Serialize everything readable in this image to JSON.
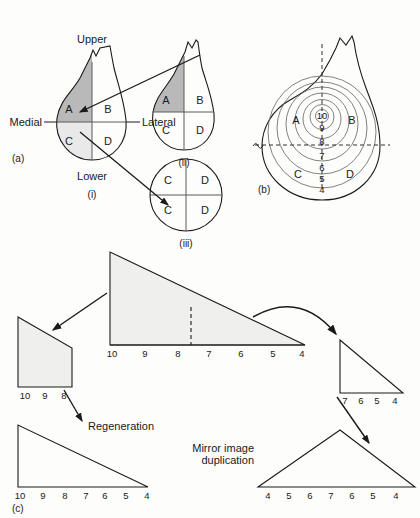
{
  "figure": {
    "background": "#fdfdfb",
    "ink": "#1a1a1a",
    "shade_dark": "#b9b9b9",
    "shade_light": "#e9e9e9",
    "shade_fill": "#efefed"
  },
  "panel_a": {
    "id": "(a)",
    "diagrams": [
      {
        "id": "(i)",
        "shape": "limb-bud-teardrop",
        "quadrants": [
          {
            "label": "A",
            "shade": "dark"
          },
          {
            "label": "B",
            "shade": "none"
          },
          {
            "label": "C",
            "shade": "light"
          },
          {
            "label": "D",
            "shade": "none"
          }
        ],
        "axis_labels": {
          "top": "Upper",
          "bottom": "Lower",
          "left": "Medial",
          "right": "Lateral"
        }
      },
      {
        "id": "(ii)",
        "shape": "limb-bud-teardrop",
        "quadrants": [
          {
            "label": "A",
            "shade": "dark"
          },
          {
            "label": "B",
            "shade": "none"
          },
          {
            "label": "C",
            "shade": "none"
          },
          {
            "label": "D",
            "shade": "none"
          }
        ]
      },
      {
        "id": "(iii)",
        "shape": "circle",
        "quadrants": [
          {
            "label": "C",
            "shade": "none"
          },
          {
            "label": "D",
            "shade": "none"
          },
          {
            "label": "C",
            "shade": "none"
          },
          {
            "label": "D",
            "shade": "none"
          }
        ]
      }
    ],
    "arrows": [
      {
        "from": "(i) quadrant A",
        "to": "(ii) quadrant A"
      },
      {
        "from": "(i) quadrant C",
        "to": "(iii) lower-left quadrant C"
      }
    ]
  },
  "panel_b": {
    "id": "(b)",
    "shape": "limb-bud-teardrop",
    "model": "polar-coordinate-contour-map",
    "ring_values": [
      10,
      9,
      8,
      7,
      6,
      5,
      4
    ],
    "center_value": 10,
    "quadrant_labels": [
      "A",
      "B",
      "C",
      "D"
    ],
    "axes": "dashed-crosshair"
  },
  "panel_c": {
    "id": "(c)",
    "shapes": [
      {
        "name": "intact-cone",
        "type": "right-triangle",
        "filled": true,
        "scale": [
          10,
          9,
          8,
          7,
          6,
          5,
          4
        ],
        "cut_line": "dashed between 8 and 7"
      },
      {
        "name": "proximal-fragment",
        "type": "trapezoid",
        "filled": true,
        "scale": [
          10,
          9,
          8
        ]
      },
      {
        "name": "regenerated-cone",
        "type": "right-triangle",
        "filled": false,
        "scale": [
          10,
          9,
          8,
          7,
          6,
          5,
          4
        ]
      },
      {
        "name": "distal-fragment",
        "type": "right-triangle",
        "filled": false,
        "scale": [
          7,
          6,
          5,
          4
        ]
      },
      {
        "name": "mirror-image-cone",
        "type": "isosceles-triangle",
        "filled": false,
        "scale": [
          4,
          5,
          6,
          7,
          6,
          5,
          4
        ]
      }
    ],
    "annotations": [
      {
        "name": "regeneration-label",
        "text": "Regeneration"
      },
      {
        "name": "mirror-label-line1",
        "text": "Mirror image"
      },
      {
        "name": "mirror-label-line2",
        "text": "duplication"
      }
    ]
  }
}
